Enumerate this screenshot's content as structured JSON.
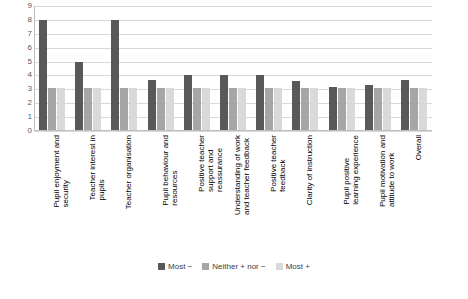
{
  "chart_data": {
    "type": "bar",
    "title": "",
    "xlabel": "",
    "ylabel": "",
    "ylim": [
      0,
      9
    ],
    "yticks": [
      0,
      1,
      2,
      3,
      4,
      5,
      6,
      7,
      8,
      9
    ],
    "grid": true,
    "legend_position": "bottom",
    "categories": [
      "Pupil enjoyment and security",
      "Teacher interest in pupils",
      "Teacher organisation",
      "Pupil behaviour and resources",
      "Positive teacher support and reassurance",
      "Understanding of work and teacher feedback",
      "Positive teacher feedback",
      "Clarity of instruction",
      "Pupil positive learning experience",
      "Pupil motivation and attitude to work",
      "Overall"
    ],
    "series": [
      {
        "name": "Most −",
        "color": "#595959",
        "values": [
          8,
          5,
          8,
          3.7,
          4,
          4,
          4,
          3.6,
          3.2,
          3.3,
          3.7
        ]
      },
      {
        "name": "Neither + nor −",
        "color": "#a6a6a6",
        "values": [
          3.1,
          3.1,
          3.1,
          3.1,
          3.1,
          3.1,
          3.1,
          3.1,
          3.1,
          3.1,
          3.1
        ]
      },
      {
        "name": "Most +",
        "color": "#d9d9d9",
        "values": [
          3.1,
          3.1,
          3.1,
          3.1,
          3.1,
          3.1,
          3.1,
          3.1,
          3.1,
          3.1,
          3.1
        ]
      }
    ]
  }
}
